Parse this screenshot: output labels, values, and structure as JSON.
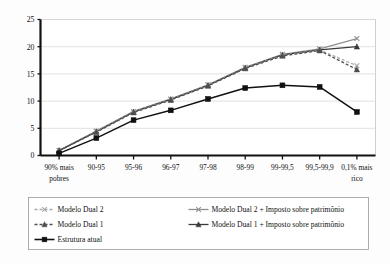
{
  "chart_data": {
    "type": "line",
    "title": "",
    "subtitle": "",
    "xlabel": "",
    "ylabel": "",
    "ylim": [
      0,
      25
    ],
    "yticks": [
      0,
      5,
      10,
      15,
      20,
      25
    ],
    "grid": true,
    "legend_position": "bottom",
    "categories": [
      "90% mais pobres",
      "90-95",
      "95-96",
      "96-97",
      "97-98",
      "98-99",
      "99-99,5",
      "99,5-99,9",
      "0,1% mais rico"
    ],
    "category_lines": [
      [
        "90% mais",
        "pobres"
      ],
      [
        "90-95",
        ""
      ],
      [
        "95-96",
        ""
      ],
      [
        "96-97",
        ""
      ],
      [
        "97-98",
        ""
      ],
      [
        "98-99",
        ""
      ],
      [
        "99-99,5",
        ""
      ],
      [
        "99,5-99,9",
        ""
      ],
      [
        "0,1% mais",
        "rico"
      ]
    ],
    "series": [
      {
        "name": "Modelo Dual 2",
        "color": "#a8a8a8",
        "dash": "3,2",
        "marker": "x",
        "values": [
          0.9,
          4.4,
          8.0,
          10.3,
          12.9,
          16.1,
          18.4,
          19.4,
          16.5
        ]
      },
      {
        "name": "Modelo Dual 1",
        "color": "#4d4d4d",
        "dash": "3,2",
        "marker": "triangle",
        "values": [
          0.9,
          4.3,
          7.9,
          10.2,
          12.8,
          16.0,
          18.3,
          19.3,
          15.8
        ]
      },
      {
        "name": "Estrutura atual",
        "color": "#111111",
        "dash": "none",
        "marker": "square",
        "values": [
          0.4,
          3.2,
          6.5,
          8.3,
          10.4,
          12.4,
          12.9,
          12.6,
          8.0
        ]
      },
      {
        "name": "Modelo Dual 2 + Imposto sobre patrimônio",
        "color": "#8f8f8f",
        "dash": "none",
        "marker": "x",
        "values": [
          0.9,
          4.5,
          8.1,
          10.4,
          13.0,
          16.2,
          18.6,
          19.6,
          21.5
        ]
      },
      {
        "name": "Modelo Dual 1 + Imposto sobre patrimônio",
        "color": "#3a3a3a",
        "dash": "none",
        "marker": "triangle",
        "values": [
          0.9,
          4.4,
          8.0,
          10.3,
          12.9,
          16.1,
          18.5,
          19.4,
          20.0
        ]
      }
    ]
  },
  "legend": {
    "column_left": [
      {
        "label": "Modelo Dual 2",
        "series_index": 0
      },
      {
        "label": "Modelo Dual 1",
        "series_index": 1
      },
      {
        "label": "Estrutura atual",
        "series_index": 2
      }
    ],
    "column_right": [
      {
        "label": "Modelo Dual 2 + Imposto sobre patrimônio",
        "series_index": 3
      },
      {
        "label": "Modelo Dual 1 + Imposto sobre patrimônio",
        "series_index": 4
      }
    ]
  },
  "colors": {
    "axis": "#111111",
    "grid": "#d9d9d9",
    "background": "#fdfdfd",
    "legend_border": "#9a9a9a"
  }
}
